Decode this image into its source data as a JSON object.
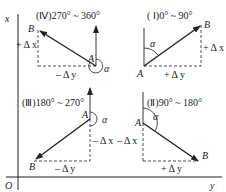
{
  "axes": {
    "origin_label": "O",
    "vertical_axis_label": "x",
    "horizontal_axis_label": "y"
  },
  "quadrants": [
    {
      "id": "IV",
      "title": "(Ⅳ)270° ~ 360°",
      "point_a": "A",
      "point_b": "B",
      "angle_label": "α",
      "dx_label": "+ Δ x",
      "dy_label": "– Δ y"
    },
    {
      "id": "I",
      "title": "( Ⅰ)0° ~ 90°",
      "point_a": "A",
      "point_b": "B",
      "angle_label": "α",
      "dx_label": "+ Δ x",
      "dy_label": "+ Δ y"
    },
    {
      "id": "III",
      "title": "(Ⅲ)180° ~ 270°",
      "point_a": "A",
      "point_b": "B",
      "angle_label": "α",
      "dx_label": "– Δ x",
      "dy_label": "– Δ y"
    },
    {
      "id": "II",
      "title": "(Ⅱ)90° ~ 180°",
      "point_a": "A",
      "point_b": "B",
      "angle_label": "α",
      "dx_label": "– Δ x",
      "dy_label": "+ Δ y"
    }
  ]
}
